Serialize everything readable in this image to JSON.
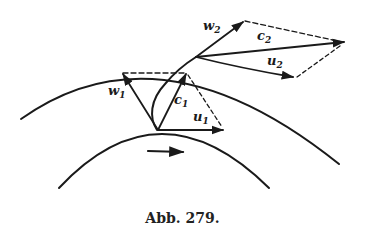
{
  "figure": {
    "caption": "Abb. 279.",
    "labels": {
      "w1": {
        "base": "w",
        "sub": "1"
      },
      "c1": {
        "base": "c",
        "sub": "1"
      },
      "u1": {
        "base": "u",
        "sub": "1"
      },
      "w2": {
        "base": "w",
        "sub": "2"
      },
      "c2": {
        "base": "c",
        "sub": "2"
      },
      "u2": {
        "base": "u",
        "sub": "2"
      }
    },
    "colors": {
      "ink": "#1a1a1a",
      "background": "#ffffff"
    }
  }
}
